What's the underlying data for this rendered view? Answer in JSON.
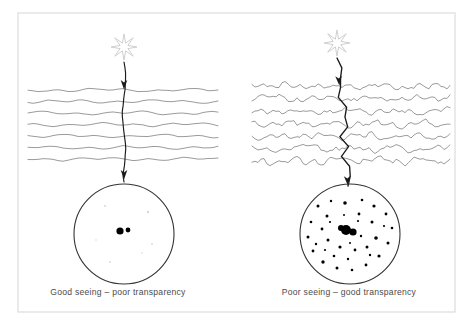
{
  "figure": {
    "background_color": "#ffffff",
    "frame": {
      "name": "figure-border",
      "x": 18,
      "y": 13,
      "width": 437,
      "height": 299,
      "stroke_color": "#dcdcdc",
      "stroke_width": 1.2
    },
    "ink_color": "#1a1a1a",
    "wave_color": "#7a7a7a",
    "star_color": "#c9c9c9",
    "dot_color": "#000000",
    "faint_dot_color": "#d8d8d8",
    "circle_stroke_color": "#333333"
  },
  "panels": [
    {
      "id": "left",
      "name": "panel-good-seeing",
      "caption": "Good seeing – poor transparency",
      "caption_x": 118,
      "caption_y": 295,
      "seeing": "good",
      "transparency": "poor",
      "star": {
        "name": "star-icon",
        "cx": 124,
        "cy": 47,
        "outer_radius": 13,
        "inner_radius": 4.2,
        "points": 8,
        "label": "starburst source"
      },
      "ray": {
        "name": "light-ray-path",
        "description": "near-vertical gently wavering ray, small deviation (good seeing)",
        "start_x": 124,
        "start_y": 62,
        "end_x": 124,
        "end_y": 182,
        "amplitude": 1.6,
        "arrow_top_y": 88,
        "arrow_bottom_y": 178
      },
      "atmosphere": {
        "name": "atmosphere-layers",
        "description": "smooth gently undulating horizontal layers (stable air, but thick haze)",
        "line_count": 7,
        "x_start": 28,
        "x_end": 222,
        "y_first": 90,
        "y_spacing": 11.5,
        "roughness": "low",
        "amplitude": 2.6,
        "wavelength": 34
      },
      "eyepiece": {
        "name": "telescope-field-circle",
        "cx": 124,
        "cy": 234,
        "r": 50
      },
      "stars_in_field": {
        "name": "star-field-dots",
        "bright": [
          {
            "x": 120,
            "y": 231,
            "r": 3.6
          },
          {
            "x": 128,
            "y": 230,
            "r": 2.4
          }
        ],
        "faint": [
          {
            "x": 105,
            "y": 206,
            "r": 1.0
          },
          {
            "x": 148,
            "y": 212,
            "r": 1.2
          },
          {
            "x": 152,
            "y": 244,
            "r": 1.0
          },
          {
            "x": 110,
            "y": 262,
            "r": 0.9
          },
          {
            "x": 142,
            "y": 253,
            "r": 0.8
          },
          {
            "x": 96,
            "y": 240,
            "r": 0.8
          }
        ]
      }
    },
    {
      "id": "right",
      "name": "panel-poor-seeing",
      "caption": "Poor seeing – good transparency",
      "caption_x": 349,
      "caption_y": 295,
      "seeing": "poor",
      "transparency": "good",
      "star": {
        "name": "star-icon",
        "cx": 337,
        "cy": 43,
        "outer_radius": 13,
        "inner_radius": 4.2,
        "points": 8,
        "label": "starburst source"
      },
      "ray": {
        "name": "light-ray-path",
        "description": "strongly zig-zagging refracted ray (poor seeing), ends angled into field",
        "start_x": 337,
        "start_y": 58,
        "end_x": 348,
        "end_y": 186,
        "amplitude": 5.5,
        "arrow_top_y": 84,
        "arrow_bottom_y": 184
      },
      "atmosphere": {
        "name": "atmosphere-layers",
        "description": "highly turbulent jagged horizontal layers (unstable air, clear sky)",
        "line_count": 7,
        "x_start": 252,
        "x_end": 450,
        "y_first": 86,
        "y_spacing": 12.5,
        "roughness": "high",
        "amplitude": 4.4,
        "wavelength": 17
      },
      "eyepiece": {
        "name": "telescope-field-circle",
        "cx": 350,
        "cy": 234,
        "r": 50
      },
      "stars_in_field": {
        "name": "star-field-dots",
        "bright": [
          {
            "x": 346,
            "y": 230,
            "r": 5.0
          },
          {
            "x": 353,
            "y": 232,
            "r": 3.6
          },
          {
            "x": 341,
            "y": 228,
            "r": 3.0
          }
        ],
        "faint": [
          {
            "x": 318,
            "y": 206,
            "r": 1.5
          },
          {
            "x": 331,
            "y": 201,
            "r": 1.2
          },
          {
            "x": 345,
            "y": 203,
            "r": 1.8
          },
          {
            "x": 362,
            "y": 200,
            "r": 1.3
          },
          {
            "x": 374,
            "y": 206,
            "r": 1.6
          },
          {
            "x": 386,
            "y": 214,
            "r": 1.4
          },
          {
            "x": 392,
            "y": 228,
            "r": 1.3
          },
          {
            "x": 388,
            "y": 243,
            "r": 1.5
          },
          {
            "x": 379,
            "y": 256,
            "r": 1.6
          },
          {
            "x": 366,
            "y": 265,
            "r": 1.4
          },
          {
            "x": 352,
            "y": 270,
            "r": 1.3
          },
          {
            "x": 337,
            "y": 268,
            "r": 1.5
          },
          {
            "x": 323,
            "y": 262,
            "r": 1.7
          },
          {
            "x": 313,
            "y": 251,
            "r": 1.4
          },
          {
            "x": 308,
            "y": 237,
            "r": 1.5
          },
          {
            "x": 311,
            "y": 222,
            "r": 1.3
          },
          {
            "x": 327,
            "y": 216,
            "r": 1.5
          },
          {
            "x": 359,
            "y": 214,
            "r": 1.4
          },
          {
            "x": 372,
            "y": 222,
            "r": 1.5
          },
          {
            "x": 376,
            "y": 238,
            "r": 1.8
          },
          {
            "x": 367,
            "y": 247,
            "r": 1.5
          },
          {
            "x": 355,
            "y": 250,
            "r": 1.4
          },
          {
            "x": 340,
            "y": 247,
            "r": 1.6
          },
          {
            "x": 328,
            "y": 240,
            "r": 1.5
          },
          {
            "x": 322,
            "y": 229,
            "r": 1.4
          },
          {
            "x": 334,
            "y": 256,
            "r": 1.3
          },
          {
            "x": 348,
            "y": 259,
            "r": 1.2
          },
          {
            "x": 361,
            "y": 236,
            "r": 1.2
          },
          {
            "x": 330,
            "y": 222,
            "r": 1.1
          },
          {
            "x": 384,
            "y": 226,
            "r": 1.1
          },
          {
            "x": 316,
            "y": 244,
            "r": 1.2
          },
          {
            "x": 358,
            "y": 221,
            "r": 1.1
          },
          {
            "x": 344,
            "y": 215,
            "r": 1.0
          },
          {
            "x": 370,
            "y": 255,
            "r": 1.2
          },
          {
            "x": 325,
            "y": 250,
            "r": 1.1
          },
          {
            "x": 350,
            "y": 243,
            "r": 1.0
          }
        ]
      }
    }
  ]
}
